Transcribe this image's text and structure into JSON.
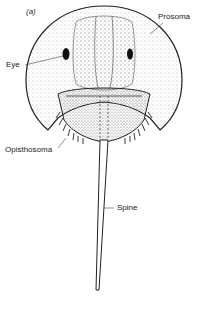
{
  "figure": {
    "panel_label": "(a)",
    "labels": {
      "prosoma": "Prosoma",
      "eye": "Eye",
      "opisthosoma": "Opisthosoma",
      "spine": "Spine"
    },
    "colors": {
      "ink": "#222222",
      "background": "#ffffff"
    }
  }
}
